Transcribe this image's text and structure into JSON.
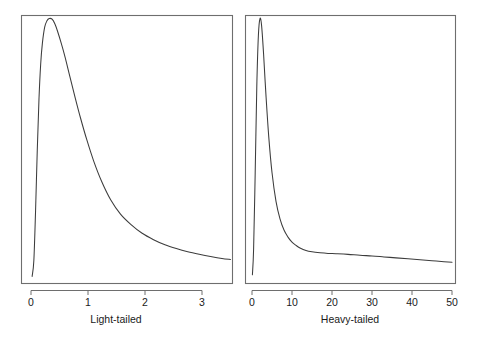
{
  "figure": {
    "background_color": "#ffffff",
    "frame_color": "#6e6e6e",
    "curve_color": "#3c3c3c",
    "text_color": "#1a1a1a"
  },
  "chart_data": [
    {
      "type": "line",
      "title": "",
      "xlabel": "Light-tailed",
      "ylabel": "",
      "xlim": [
        0,
        3.5
      ],
      "ylim": [
        0,
        0.82
      ],
      "xticks": [
        0,
        1,
        2,
        3
      ],
      "xtick_labels": [
        "0",
        "1",
        "2",
        "3"
      ],
      "yticks": [],
      "ytick_labels": [],
      "grid": false,
      "legend": null,
      "panel": "left",
      "description": "Light-tailed density: rises steeply to a peak near x=0.37 then decays smoothly toward zero",
      "x": [
        0.02,
        0.05,
        0.08,
        0.11,
        0.14,
        0.17,
        0.2,
        0.24,
        0.28,
        0.32,
        0.37,
        0.42,
        0.47,
        0.53,
        0.6,
        0.68,
        0.77,
        0.87,
        0.98,
        1.1,
        1.24,
        1.4,
        1.57,
        1.75,
        1.95,
        2.15,
        2.35,
        2.55,
        2.75,
        2.95,
        3.15,
        3.35,
        3.5
      ],
      "y": [
        0.005,
        0.055,
        0.21,
        0.4,
        0.56,
        0.67,
        0.735,
        0.785,
        0.805,
        0.812,
        0.81,
        0.795,
        0.77,
        0.735,
        0.69,
        0.632,
        0.568,
        0.5,
        0.432,
        0.366,
        0.302,
        0.244,
        0.2,
        0.168,
        0.14,
        0.12,
        0.104,
        0.092,
        0.082,
        0.074,
        0.067,
        0.061,
        0.058
      ]
    },
    {
      "type": "line",
      "title": "",
      "xlabel": "Heavy-tailed",
      "ylabel": "",
      "xlim": [
        0,
        50
      ],
      "ylim": [
        0,
        0.82
      ],
      "xticks": [
        0,
        10,
        20,
        30,
        40,
        50
      ],
      "xtick_labels": [
        "0",
        "10",
        "20",
        "30",
        "40",
        "50"
      ],
      "yticks": [],
      "ytick_labels": [],
      "grid": false,
      "legend": null,
      "panel": "right",
      "description": "Heavy-tailed density: very sharp narrow peak near x=2 then a long slowly-declining tail extending to x=50",
      "x": [
        0.1,
        0.4,
        0.8,
        1.2,
        1.6,
        2.0,
        2.4,
        2.9,
        3.5,
        4.2,
        5.0,
        6.0,
        7.0,
        8.0,
        9.0,
        10.0,
        11.0,
        12.0,
        13.5,
        15.0,
        17.0,
        19.0,
        21.0,
        24.0,
        27.0,
        30.0,
        33.0,
        36.0,
        39.0,
        42.0,
        45.0,
        48.0,
        50.0
      ],
      "y": [
        0.01,
        0.09,
        0.33,
        0.6,
        0.76,
        0.812,
        0.79,
        0.7,
        0.57,
        0.44,
        0.33,
        0.24,
        0.185,
        0.15,
        0.128,
        0.112,
        0.102,
        0.094,
        0.086,
        0.082,
        0.079,
        0.077,
        0.076,
        0.074,
        0.071,
        0.069,
        0.066,
        0.063,
        0.06,
        0.057,
        0.054,
        0.051,
        0.049
      ]
    }
  ],
  "panels": {
    "light": {
      "caption": "Light-tailed",
      "tick_labels": [
        "0",
        "1",
        "2",
        "3"
      ]
    },
    "heavy": {
      "caption": "Heavy-tailed",
      "tick_labels": [
        "0",
        "10",
        "20",
        "30",
        "40",
        "50"
      ]
    }
  }
}
